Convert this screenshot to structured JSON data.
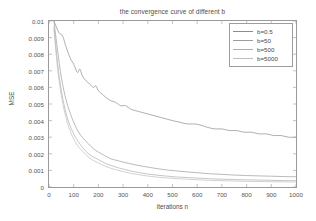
{
  "chart_data": {
    "type": "line",
    "title": "the convergence curve of different b",
    "xlabel": "iterations n",
    "ylabel": "MSE",
    "xlim": [
      0,
      1000
    ],
    "ylim": [
      0,
      0.01
    ],
    "xticks": [
      0,
      100,
      200,
      300,
      400,
      500,
      600,
      700,
      800,
      900,
      1000
    ],
    "xtick_labels": [
      "0",
      "100",
      "200",
      "300",
      "400",
      "500",
      "600",
      "700",
      "800",
      "900",
      "1000"
    ],
    "yticks": [
      0,
      0.001,
      0.002,
      0.003,
      0.004,
      0.005,
      0.006,
      0.007,
      0.008,
      0.009,
      0.01
    ],
    "ytick_labels": [
      "0",
      "0.001",
      "0.002",
      "0.003",
      "0.004",
      "0.005",
      "0.006",
      "0.007",
      "0.008",
      "0.009",
      "0.01"
    ],
    "grid": false,
    "legend_position": "upper right",
    "series": [
      {
        "name": "b=0.5",
        "color": "#8c8c8c",
        "x": [
          20,
          40,
          55,
          70,
          85,
          100,
          115,
          125,
          135,
          150,
          165,
          180,
          190,
          200,
          215,
          230,
          250,
          270,
          290,
          310,
          330,
          350,
          375,
          400,
          425,
          450,
          475,
          500,
          530,
          560,
          590,
          620,
          640,
          670,
          700,
          730,
          760,
          790,
          820,
          850,
          880,
          910,
          940,
          970,
          1000
        ],
        "y": [
          0.01,
          0.0093,
          0.0091,
          0.0084,
          0.0078,
          0.0074,
          0.0069,
          0.0071,
          0.0067,
          0.0064,
          0.0062,
          0.006,
          0.0061,
          0.0058,
          0.0056,
          0.0054,
          0.0052,
          0.0051,
          0.0049,
          0.0049,
          0.0047,
          0.0046,
          0.0045,
          0.0044,
          0.0043,
          0.0042,
          0.0041,
          0.004,
          0.0039,
          0.0038,
          0.0038,
          0.0037,
          0.0036,
          0.0035,
          0.0035,
          0.0034,
          0.0034,
          0.0033,
          0.0033,
          0.0032,
          0.0032,
          0.0031,
          0.0031,
          0.003,
          0.003
        ]
      },
      {
        "name": "b=50",
        "color": "#9c9c9c",
        "x": [
          20,
          35,
          50,
          65,
          80,
          100,
          120,
          140,
          160,
          180,
          200,
          225,
          250,
          275,
          300,
          330,
          360,
          400,
          440,
          480,
          520,
          560,
          600,
          650,
          700,
          750,
          800,
          850,
          900,
          950,
          1000
        ],
        "y": [
          0.01,
          0.0082,
          0.0066,
          0.0055,
          0.0047,
          0.0039,
          0.0033,
          0.0029,
          0.0026,
          0.0023,
          0.0021,
          0.0019,
          0.0017,
          0.0016,
          0.0015,
          0.0014,
          0.0013,
          0.0012,
          0.0011,
          0.00102,
          0.00096,
          0.00091,
          0.00086,
          0.0008,
          0.00076,
          0.00072,
          0.00069,
          0.00067,
          0.00065,
          0.00063,
          0.00062
        ]
      },
      {
        "name": "b=500",
        "color": "#adadad",
        "x": [
          20,
          35,
          50,
          65,
          80,
          100,
          120,
          140,
          160,
          180,
          200,
          225,
          250,
          275,
          300,
          330,
          360,
          400,
          440,
          480,
          520,
          560,
          600,
          650,
          700,
          750,
          800,
          850,
          900,
          950,
          1000
        ],
        "y": [
          0.0097,
          0.0074,
          0.0058,
          0.0047,
          0.0039,
          0.0032,
          0.0027,
          0.0023,
          0.002,
          0.0018,
          0.00165,
          0.00145,
          0.0013,
          0.00118,
          0.00108,
          0.00097,
          0.00088,
          0.00078,
          0.00071,
          0.00065,
          0.0006,
          0.00057,
          0.00054,
          0.0005,
          0.00047,
          0.00045,
          0.00043,
          0.00042,
          0.0004,
          0.00039,
          0.00038
        ]
      },
      {
        "name": "b=5000",
        "color": "#bdbdbd",
        "x": [
          20,
          35,
          50,
          65,
          80,
          100,
          120,
          140,
          160,
          180,
          200,
          225,
          250,
          275,
          300,
          330,
          360,
          400,
          440,
          480,
          520,
          560,
          600,
          650,
          700,
          750,
          800,
          850,
          900,
          950,
          1000
        ],
        "y": [
          0.0095,
          0.0071,
          0.0055,
          0.0044,
          0.0036,
          0.0029,
          0.0024,
          0.0021,
          0.0018,
          0.0016,
          0.00145,
          0.00127,
          0.00113,
          0.00102,
          0.00093,
          0.00083,
          0.00075,
          0.00066,
          0.00059,
          0.00054,
          0.0005,
          0.00047,
          0.00044,
          0.0004,
          0.00038,
          0.00036,
          0.00034,
          0.00033,
          0.00032,
          0.00031,
          0.0003
        ]
      }
    ]
  },
  "legend": {
    "items": [
      {
        "label": "b=0.5"
      },
      {
        "label": "b=50"
      },
      {
        "label": "b=500"
      },
      {
        "label": "b=5000"
      }
    ]
  }
}
